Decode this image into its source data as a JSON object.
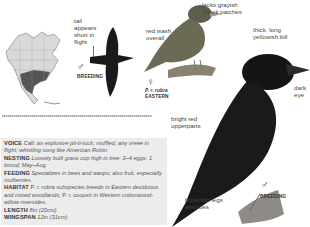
{
  "range_map": {
    "region": "North America",
    "icon": "range-map"
  },
  "flight_figure": {
    "annotation": "tail appears short in flight",
    "sex_symbol": "♂",
    "plumage": "BREEDING"
  },
  "female_figure": {
    "annotations": [
      "lacks grayish cheek patches",
      "red wash overall"
    ],
    "sex_symbol": "♀",
    "subspecies": "P. r. rubra",
    "region": "EASTERN"
  },
  "male_figure": {
    "annotations": [
      "thick, long yellowish bill",
      "dark eye",
      "bright red upperparts",
      "brownish legs and toes"
    ],
    "sex_symbol": "♂",
    "plumage": "BREEDING"
  },
  "colors": {
    "info_bg": "#ececec",
    "bird_dark": "#1a1a1a",
    "female_body": "#6b6a55"
  },
  "info": [
    {
      "heading": "VOICE",
      "text": "Call: an explosive pit-ti-tuck; muffled, airy vreee in flight; whistling song like American Robin."
    },
    {
      "heading": "NESTING",
      "text": "Loosely built grass cup high in tree; 3–4 eggs; 1 brood; May–Aug."
    },
    {
      "heading": "FEEDING",
      "text": "Specializes in bees and wasps; also fruit, especially mulberries."
    },
    {
      "heading": "HABITAT",
      "text_parts": [
        "P. r. rubra",
        " subspecies breeds in Eastern deciduous and mixed woodlands; ",
        "P. r. cooperi",
        " in Western cottonwood-willow riversides."
      ]
    },
    {
      "heading": "LENGTH",
      "text": "8in (20cm)"
    },
    {
      "heading": "WINGSPAN",
      "text": "12in (31cm)"
    }
  ]
}
